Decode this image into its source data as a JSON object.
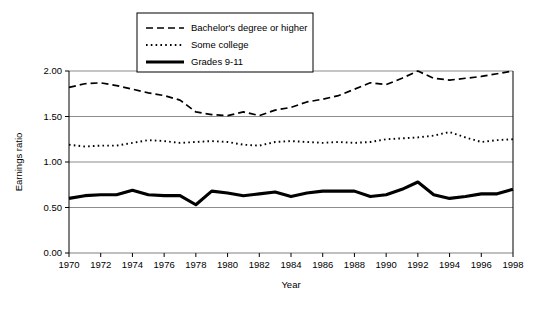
{
  "chart_data": {
    "type": "line",
    "title": "",
    "xlabel": "Year",
    "ylabel": "Earnings ratio",
    "xlim": [
      1970,
      1998
    ],
    "ylim": [
      0.0,
      2.0
    ],
    "grid": true,
    "legend_position": "top-center",
    "x": [
      1970,
      1971,
      1972,
      1973,
      1974,
      1975,
      1976,
      1977,
      1978,
      1979,
      1980,
      1981,
      1982,
      1983,
      1984,
      1985,
      1986,
      1987,
      1988,
      1989,
      1990,
      1991,
      1992,
      1993,
      1994,
      1995,
      1996,
      1997,
      1998
    ],
    "ytick_labels": [
      "0.00",
      "0.50",
      "1.00",
      "1.50",
      "2.00"
    ],
    "ytick_values": [
      0.0,
      0.5,
      1.0,
      1.5,
      2.0
    ],
    "xtick_labels": [
      "1970",
      "1972",
      "1974",
      "1976",
      "1978",
      "1980",
      "1982",
      "1984",
      "1986",
      "1988",
      "1990",
      "1992",
      "1994",
      "1996",
      "1998"
    ],
    "xtick_values": [
      1970,
      1972,
      1974,
      1976,
      1978,
      1980,
      1982,
      1984,
      1986,
      1988,
      1990,
      1992,
      1994,
      1996,
      1998
    ],
    "series": [
      {
        "name": "Bachelor's degree or higher",
        "style": "dashed",
        "color": "#000000",
        "values": [
          1.82,
          1.86,
          1.87,
          1.84,
          1.8,
          1.76,
          1.73,
          1.68,
          1.55,
          1.52,
          1.51,
          1.55,
          1.51,
          1.57,
          1.6,
          1.66,
          1.69,
          1.73,
          1.8,
          1.87,
          1.85,
          1.92,
          2.0,
          1.92,
          1.9,
          1.92,
          1.94,
          1.97,
          2.0
        ]
      },
      {
        "name": "Some college",
        "style": "dotted",
        "color": "#000000",
        "values": [
          1.19,
          1.17,
          1.18,
          1.18,
          1.21,
          1.24,
          1.23,
          1.21,
          1.22,
          1.23,
          1.22,
          1.19,
          1.18,
          1.22,
          1.23,
          1.22,
          1.21,
          1.22,
          1.21,
          1.22,
          1.25,
          1.26,
          1.27,
          1.29,
          1.33,
          1.27,
          1.22,
          1.24,
          1.25
        ]
      },
      {
        "name": "Grades 9-11",
        "style": "solid-thick",
        "color": "#000000",
        "values": [
          0.6,
          0.63,
          0.64,
          0.64,
          0.69,
          0.64,
          0.63,
          0.63,
          0.53,
          0.68,
          0.66,
          0.63,
          0.65,
          0.67,
          0.62,
          0.66,
          0.68,
          0.68,
          0.68,
          0.62,
          0.64,
          0.7,
          0.78,
          0.64,
          0.6,
          0.62,
          0.65,
          0.65,
          0.7
        ]
      }
    ]
  },
  "legend": {
    "items": [
      {
        "label": "Bachelor's degree or higher"
      },
      {
        "label": "Some college"
      },
      {
        "label": "Grades 9-11"
      }
    ]
  }
}
